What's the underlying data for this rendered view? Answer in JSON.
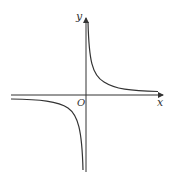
{
  "diagram": {
    "type": "function-graph",
    "axes": {
      "x_label": "x",
      "y_label": "y",
      "origin_label": "O"
    },
    "colors": {
      "axis": "#333333",
      "curve": "#333333",
      "background": "#ffffff"
    }
  }
}
